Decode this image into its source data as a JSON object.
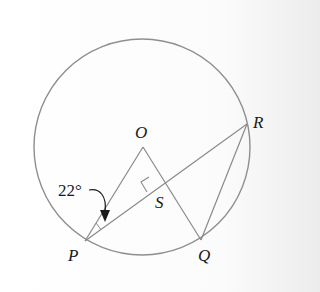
{
  "diagram": {
    "type": "circle-geometry",
    "circle": {
      "center_label": "O"
    },
    "points": {
      "O": "O",
      "P": "P",
      "Q": "Q",
      "R": "R",
      "S": "S"
    },
    "segments": [
      "OP",
      "OQ",
      "PR",
      "QR"
    ],
    "right_angle_at": "S",
    "angle_annotation": {
      "value": "22°",
      "at": "P",
      "between": [
        "OP",
        "PR"
      ]
    },
    "colors": {
      "stroke": "#8a8a8a",
      "text": "#1a1a1a",
      "arrow": "#1a1a1a"
    }
  }
}
